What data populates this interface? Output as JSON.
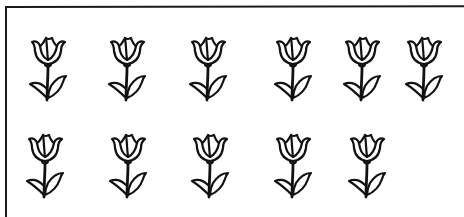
{
  "illustration": {
    "subject": "tulips",
    "count_total": 11,
    "rows": [
      {
        "label": "row-1",
        "count": 6,
        "tulips": [
          {
            "x": 26,
            "y": 36
          },
          {
            "x": 105,
            "y": 36
          },
          {
            "x": 186,
            "y": 36
          },
          {
            "x": 271,
            "y": 36
          },
          {
            "x": 340,
            "y": 36
          },
          {
            "x": 402,
            "y": 36
          }
        ]
      },
      {
        "label": "row-2",
        "count": 5,
        "tulips": [
          {
            "x": 23,
            "y": 133
          },
          {
            "x": 106,
            "y": 133
          },
          {
            "x": 188,
            "y": 133
          },
          {
            "x": 271,
            "y": 133
          },
          {
            "x": 345,
            "y": 133
          }
        ]
      }
    ],
    "colors": {
      "line": "#111111",
      "background": "#ffffff",
      "frame": "#1a1a1a"
    }
  }
}
